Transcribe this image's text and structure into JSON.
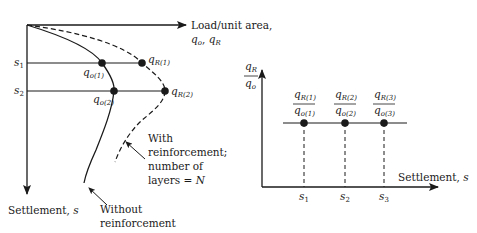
{
  "figure": {
    "left_plot": {
      "x_axis_label_line1": "Load/unit area,",
      "x_axis_label_line2_a": "q",
      "x_axis_label_line2_a_sub": "o",
      "x_axis_label_line2_sep": ", ",
      "x_axis_label_line2_b": "q",
      "x_axis_label_line2_b_sub": "R",
      "y_axis_label": "Settlement, ",
      "y_axis_label_var": "s",
      "settlement_levels": [
        {
          "label": "s",
          "sub": "1",
          "qo_label": "q",
          "qo_sub": "o(1)",
          "qr_label": "q",
          "qr_sub": "R(1)"
        },
        {
          "label": "s",
          "sub": "2",
          "qo_label": "q",
          "qo_sub": "o(2)",
          "qr_label": "q",
          "qr_sub": "R(2)"
        }
      ],
      "curves": [
        {
          "name": "without-reinforcement",
          "style": "solid",
          "annotation": [
            "Without",
            "reinforcement"
          ]
        },
        {
          "name": "with-reinforcement",
          "style": "dashed",
          "annotation": [
            "With",
            "reinforcement;",
            "number of",
            "layers = "
          ],
          "annotation_var": "N"
        }
      ]
    },
    "right_plot": {
      "y_axis_label_num": "q",
      "y_axis_label_num_sub": "R",
      "y_axis_label_den": "q",
      "y_axis_label_den_sub": "o",
      "x_axis_label": "Settlement, ",
      "x_axis_label_var": "s",
      "points": [
        {
          "num": "q",
          "num_sub": "R(1)",
          "den": "q",
          "den_sub": "o(1)",
          "tick": "s",
          "tick_sub": "1"
        },
        {
          "num": "q",
          "num_sub": "R(2)",
          "den": "q",
          "den_sub": "o(2)",
          "tick": "s",
          "tick_sub": "2"
        },
        {
          "num": "q",
          "num_sub": "R(3)",
          "den": "q",
          "den_sub": "o(3)",
          "tick": "s",
          "tick_sub": "3"
        }
      ]
    },
    "colors": {
      "ink": "#1a1a1a",
      "background": "#ffffff"
    }
  }
}
